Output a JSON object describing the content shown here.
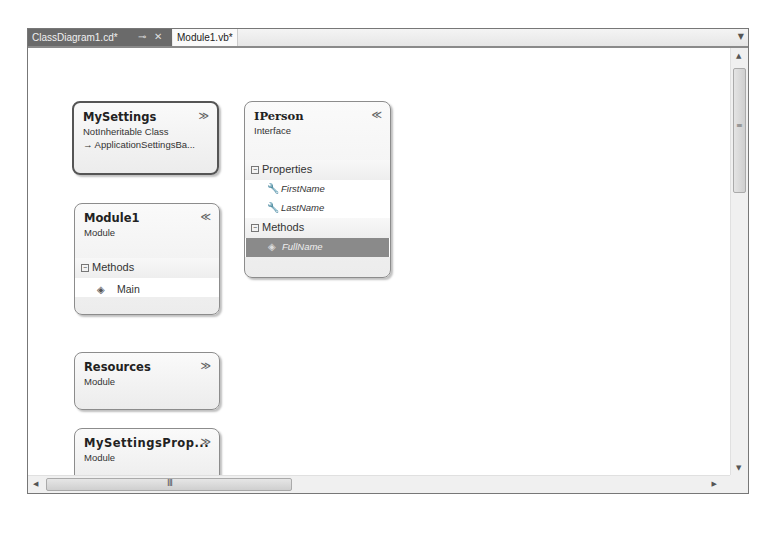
{
  "tabs": [
    {
      "label": "ClassDiagram1.cd*",
      "active": true,
      "pin_icon": "pin-icon",
      "close_icon": "close-icon"
    },
    {
      "label": "Module1.vb*",
      "active": false
    }
  ],
  "tab_dropdown_icon": "chevron-down-icon",
  "colors": {
    "active_tab_bg": "#6a6a6a",
    "selected_member_bg": "#8a8a8a",
    "box_border": "#8c8c8c"
  },
  "shapes": [
    {
      "id": "mysettings",
      "name": "MySettings",
      "stereotype": "NotInheritable Class",
      "base": "→ ApplicationSettingsBa...",
      "collapsed": true,
      "toggle": "≫"
    },
    {
      "id": "iperson",
      "name": "IPerson",
      "stereotype": "Interface",
      "collapsed": false,
      "toggle": "≪",
      "sections": [
        {
          "label": "Properties",
          "members": [
            {
              "name": "FirstName",
              "icon": "wrench-property-icon"
            },
            {
              "name": "LastName",
              "icon": "wrench-property-icon"
            }
          ]
        },
        {
          "label": "Methods",
          "members": [
            {
              "name": "FullName",
              "icon": "method-icon",
              "selected": true
            }
          ]
        }
      ]
    },
    {
      "id": "module1",
      "name": "Module1",
      "stereotype": "Module",
      "collapsed": false,
      "toggle": "≪",
      "sections": [
        {
          "label": "Methods",
          "members": [
            {
              "name": "Main",
              "icon": "method-icon"
            }
          ]
        }
      ]
    },
    {
      "id": "resources",
      "name": "Resources",
      "stereotype": "Module",
      "collapsed": true,
      "toggle": "≫"
    },
    {
      "id": "mysettingsprop",
      "name": "MySettingsProp...",
      "stereotype": "Module",
      "collapsed": true,
      "toggle": "≫"
    }
  ],
  "scrollbars": {
    "vertical": {
      "up": "▲",
      "down": "▼",
      "grip": "≡"
    },
    "horizontal": {
      "left": "◀",
      "right": "▶",
      "grip": "III"
    }
  },
  "glyphs": {
    "pin": "⊸",
    "close": "✕",
    "dropdown": "▼",
    "minus": "−",
    "wrench": "🔧",
    "method": "◈"
  }
}
